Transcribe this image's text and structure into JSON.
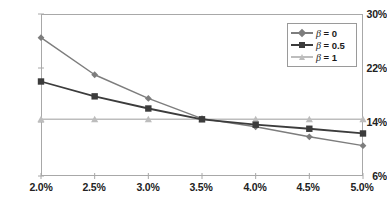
{
  "chart_data": {
    "type": "line",
    "title": "",
    "xlabel": "",
    "ylabel": "",
    "categories": [
      "2.0%",
      "2.5%",
      "3.0%",
      "3.5%",
      "4.0%",
      "4.5%",
      "5.0%"
    ],
    "x": [
      2.0,
      2.5,
      3.0,
      3.5,
      4.0,
      4.5,
      5.0
    ],
    "xlim": [
      2.0,
      5.0
    ],
    "ylim": [
      6,
      30
    ],
    "yticks": [
      6,
      14,
      22,
      30
    ],
    "ytick_labels": [
      "6%",
      "14%",
      "22%",
      "30%"
    ],
    "xtick_labels": [
      "2.0%",
      "2.5%",
      "3.0%",
      "3.5%",
      "4.0%",
      "4.5%",
      "5.0%"
    ],
    "grid": false,
    "legend_position": "top-right",
    "series": [
      {
        "name": "β = 0",
        "symbol": "β",
        "value": "0",
        "color": "#7d7d7d",
        "marker": "diamond",
        "values": [
          26.5,
          21.0,
          17.5,
          14.5,
          13.3,
          11.8,
          10.5
        ]
      },
      {
        "name": "β = 0.5",
        "symbol": "β",
        "value": "0.5",
        "color": "#3c3c3c",
        "marker": "square",
        "values": [
          20.0,
          17.8,
          16.0,
          14.4,
          13.6,
          13.0,
          12.3
        ]
      },
      {
        "name": "β = 1",
        "symbol": "β",
        "value": "1",
        "color": "#bdbdbd",
        "marker": "triangle",
        "values": [
          14.4,
          14.4,
          14.4,
          14.4,
          14.4,
          14.4,
          14.4
        ]
      }
    ]
  },
  "axes": {
    "y_labels": [
      "30%",
      "22%",
      "14%",
      "6%"
    ],
    "x_labels": [
      "2.0%",
      "2.5%",
      "3.0%",
      "3.5%",
      "4.0%",
      "4.5%",
      "5.0%"
    ]
  },
  "legend": {
    "items": [
      {
        "label": "β = 0",
        "beta": "β",
        "eq": "= 0",
        "color": "#7d7d7d"
      },
      {
        "label": "β = 0.5",
        "beta": "β",
        "eq": "= 0.5",
        "color": "#3c3c3c"
      },
      {
        "label": "β = 1",
        "beta": "β",
        "eq": "= 1",
        "color": "#bdbdbd"
      }
    ]
  },
  "colors": {
    "series_beta0": "#7d7d7d",
    "series_beta05": "#3c3c3c",
    "series_beta1": "#bdbdbd",
    "axis": "#a8a8a8",
    "text": "#222222",
    "background": "#ffffff"
  }
}
